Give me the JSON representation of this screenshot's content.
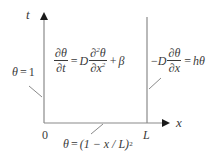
{
  "diagram": {
    "type": "pde-domain",
    "colors": {
      "line": "#8a8a8a",
      "text": "#3a3a3a",
      "arrow": "#1a1a1a"
    },
    "axes": {
      "vertical_label": "t",
      "horizontal_label": "x",
      "origin_label": "0",
      "right_boundary_label": "L"
    },
    "left_bc": {
      "lhs": "θ",
      "eq": "=",
      "rhs": "1"
    },
    "interior_pde": {
      "lhs_num": "∂θ",
      "lhs_den": "∂t",
      "eq": "=",
      "coef": "D",
      "rhs_num": "∂",
      "rhs_num_sup": "2",
      "rhs_num_var": "θ",
      "rhs_den": "∂x",
      "rhs_den_sup": "2",
      "plus": "+",
      "source": "β"
    },
    "right_bc": {
      "minus": "−",
      "coef": "D",
      "num": "∂θ",
      "den": "∂x",
      "eq": "=",
      "rhs": "hθ"
    },
    "initial_condition": {
      "lhs": "θ",
      "eq": "=",
      "rhs_open": "(1 − x / L)",
      "rhs_sup": "2"
    }
  }
}
